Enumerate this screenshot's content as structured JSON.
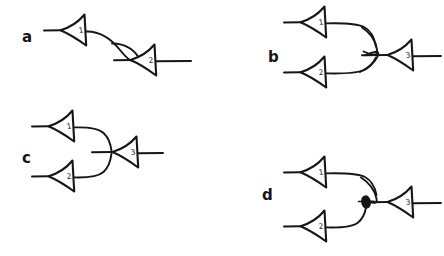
{
  "figure": {
    "background_color": "#ffffff",
    "ink_color": "#16151a",
    "width": 444,
    "height": 256,
    "style": "hand-drawn line diagram"
  },
  "panels": [
    {
      "id": "a",
      "label": "a",
      "label_x": 22,
      "label_y": 42,
      "description": "Single presynaptic neuron 1 projects a descending curved axon that terminates in a hooked bouton on the apex of neuron 2; neuron 2 emits an axon to the right.",
      "neurons": [
        {
          "number": "1",
          "role": "presynaptic",
          "apex_x": 60,
          "apex_y": 30,
          "label_x": 84,
          "label_y": 32
        },
        {
          "number": "2",
          "role": "postsynaptic",
          "apex_x": 128,
          "apex_y": 58,
          "label_x": 152,
          "label_y": 61
        }
      ],
      "connections": [
        {
          "from": "1",
          "to": "2",
          "type": "axo-dendritic",
          "ending": "hooked-terminal"
        }
      ]
    },
    {
      "id": "b",
      "label": "b",
      "label_x": 268,
      "label_y": 62,
      "description": "Two presynaptic neurons 1 and 2 converge; each axon loops around and terminates in a hooked bouton on neuron 3, which emits an axon to the right.",
      "neurons": [
        {
          "number": "1",
          "role": "presynaptic",
          "apex_x": 300,
          "apex_y": 22,
          "label_x": 324,
          "label_y": 24
        },
        {
          "number": "2",
          "role": "presynaptic",
          "apex_x": 300,
          "apex_y": 72,
          "label_x": 324,
          "label_y": 75
        },
        {
          "number": "3",
          "role": "postsynaptic",
          "apex_x": 385,
          "apex_y": 55,
          "label_x": 409,
          "label_y": 58
        }
      ],
      "connections": [
        {
          "from": "1",
          "to": "3",
          "type": "convergent",
          "ending": "hooked-terminal"
        },
        {
          "from": "2",
          "to": "3",
          "type": "convergent",
          "ending": "hooked-terminal"
        }
      ]
    },
    {
      "id": "c",
      "label": "c",
      "label_x": 22,
      "label_y": 163,
      "description": "Two presynaptic neurons 1 and 2 converge with simple curved axons that join directly at the apex of neuron 3, which emits an axon to the right.",
      "neurons": [
        {
          "number": "1",
          "role": "presynaptic",
          "apex_x": 48,
          "apex_y": 126,
          "label_x": 72,
          "label_y": 128
        },
        {
          "number": "2",
          "role": "presynaptic",
          "apex_x": 48,
          "apex_y": 176,
          "label_x": 72,
          "label_y": 179
        },
        {
          "number": "3",
          "role": "postsynaptic",
          "apex_x": 110,
          "apex_y": 152,
          "label_x": 134,
          "label_y": 155
        }
      ],
      "connections": [
        {
          "from": "1",
          "to": "3",
          "type": "convergent",
          "ending": "direct-apex"
        },
        {
          "from": "2",
          "to": "3",
          "type": "convergent",
          "ending": "direct-apex"
        }
      ]
    },
    {
      "id": "d",
      "label": "d",
      "label_x": 262,
      "label_y": 200,
      "description": "Neuron 1 terminates in a hooked bouton on neuron 3, while neuron 2 ends in a filled oval bouton on the terminal of neuron 1, forming an axo-axonic presynaptic contact.",
      "neurons": [
        {
          "number": "1",
          "role": "presynaptic",
          "apex_x": 300,
          "apex_y": 172,
          "label_x": 324,
          "label_y": 174
        },
        {
          "number": "2",
          "role": "presynaptic-modulator",
          "apex_x": 300,
          "apex_y": 226,
          "label_x": 324,
          "label_y": 229
        },
        {
          "number": "3",
          "role": "postsynaptic",
          "apex_x": 385,
          "apex_y": 202,
          "label_x": 409,
          "label_y": 205
        }
      ],
      "connections": [
        {
          "from": "1",
          "to": "3",
          "type": "axo-dendritic",
          "ending": "hooked-terminal"
        },
        {
          "from": "2",
          "to": "1",
          "type": "axo-axonic",
          "ending": "oval-bouton"
        }
      ],
      "bouton": {
        "cx": 366,
        "cy": 202,
        "rx": 4.2,
        "ry": 6.0,
        "filled": true
      }
    }
  ]
}
